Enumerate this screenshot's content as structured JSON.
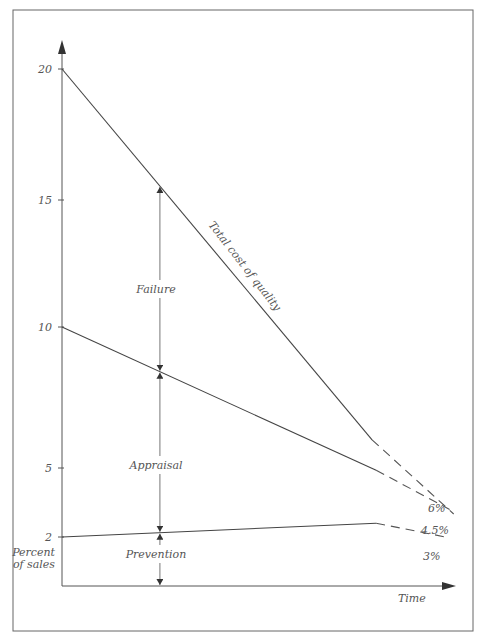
{
  "chart_data": {
    "type": "line",
    "title": "",
    "xlabel": "Time",
    "ylabel": "Percent of sales",
    "y_ticks": [
      20,
      15,
      10,
      5,
      2
    ],
    "x_range": [
      0,
      1
    ],
    "grid": false,
    "series": [
      {
        "name": "Total cost of quality",
        "label": "Total cost of quality",
        "solid": [
          {
            "t": 0,
            "v": 20
          },
          {
            "t": 0.76,
            "v": 6.0
          }
        ],
        "projected": [
          {
            "t": 0.76,
            "v": 6.0
          },
          {
            "t": 0.96,
            "v": 3.0
          }
        ],
        "end_label": "6%"
      },
      {
        "name": "Prevention + Appraisal",
        "label": "",
        "solid": [
          {
            "t": 0,
            "v": 10
          },
          {
            "t": 0.77,
            "v": 4.9
          }
        ],
        "projected": [
          {
            "t": 0.77,
            "v": 4.9
          },
          {
            "t": 0.95,
            "v": 3.2
          }
        ],
        "end_label": "4.5%"
      },
      {
        "name": "Prevention",
        "label": "",
        "solid": [
          {
            "t": 0,
            "v": 2
          },
          {
            "t": 0.77,
            "v": 2.6
          }
        ],
        "projected": [
          {
            "t": 0.77,
            "v": 2.6
          },
          {
            "t": 0.94,
            "v": 2.0
          }
        ],
        "end_label": "3%"
      }
    ],
    "bands": [
      {
        "name": "Failure",
        "label": "Failure"
      },
      {
        "name": "Appraisal",
        "label": "Appraisal"
      },
      {
        "name": "Prevention",
        "label": "Prevention"
      }
    ],
    "band_marker_t": 0.24
  },
  "labels": {
    "y_axis_line1": "Percent",
    "y_axis_line2": "of sales",
    "x_axis": "Time",
    "total_line": "Total cost of quality",
    "failure": "Failure",
    "appraisal": "Appraisal",
    "prevention": "Prevention",
    "end_total": "6%",
    "end_appraisal": "4.5%",
    "end_prevention": "3%",
    "tick_20": "20",
    "tick_15": "15",
    "tick_10": "10",
    "tick_5": "5",
    "tick_2": "2"
  }
}
